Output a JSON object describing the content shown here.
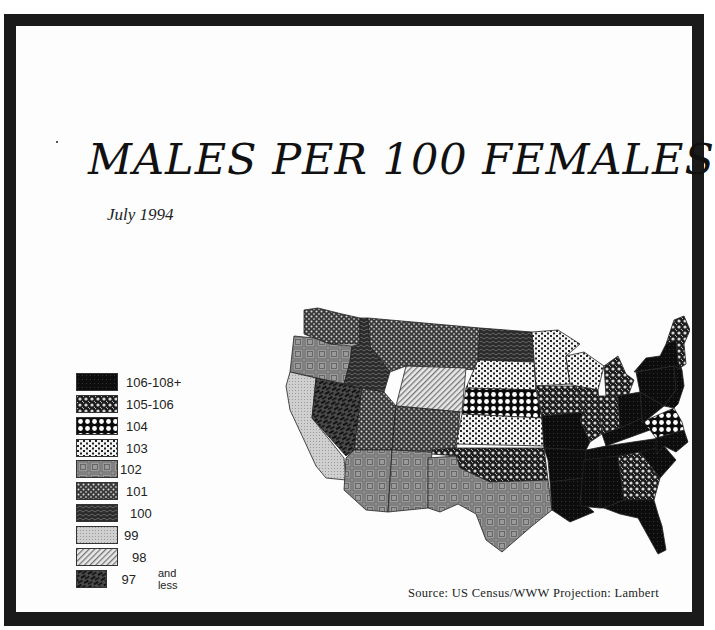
{
  "title": "MALES PER 100 FEMALES",
  "subtitle": "July 1994",
  "source": "Source: US Census/WWW Projection: Lambert",
  "legend": {
    "items": [
      {
        "label": "106-108+",
        "pattern": "p106"
      },
      {
        "label": "105-106",
        "pattern": "p105"
      },
      {
        "label": "104",
        "pattern": "p104"
      },
      {
        "label": "103",
        "pattern": "p103"
      },
      {
        "label": "102",
        "pattern": "p102"
      },
      {
        "label": "101",
        "pattern": "p101"
      },
      {
        "label": "100",
        "pattern": "p100"
      },
      {
        "label": "99",
        "pattern": "p99"
      },
      {
        "label": "98",
        "pattern": "p98"
      },
      {
        "label": "97",
        "pattern": "p97",
        "note": "and less"
      }
    ]
  },
  "map": {
    "projection": "Lambert",
    "regions": [
      {
        "name": "Washington",
        "class": "101"
      },
      {
        "name": "Oregon",
        "class": "102"
      },
      {
        "name": "California",
        "class": "99"
      },
      {
        "name": "Nevada",
        "class": "97"
      },
      {
        "name": "Idaho",
        "class": "100"
      },
      {
        "name": "Montana",
        "class": "101"
      },
      {
        "name": "Wyoming",
        "class": "98"
      },
      {
        "name": "Utah",
        "class": "101"
      },
      {
        "name": "Colorado",
        "class": "101"
      },
      {
        "name": "Arizona",
        "class": "102"
      },
      {
        "name": "New Mexico",
        "class": "102"
      },
      {
        "name": "North Dakota",
        "class": "100"
      },
      {
        "name": "South Dakota",
        "class": "103"
      },
      {
        "name": "Nebraska",
        "class": "104"
      },
      {
        "name": "Kansas",
        "class": "103"
      },
      {
        "name": "Oklahoma",
        "class": "105-106"
      },
      {
        "name": "Texas",
        "class": "102"
      },
      {
        "name": "Minnesota",
        "class": "103"
      },
      {
        "name": "Iowa",
        "class": "105-106"
      },
      {
        "name": "Missouri",
        "class": "106-108+"
      },
      {
        "name": "Wisconsin",
        "class": "103"
      },
      {
        "name": "Illinois",
        "class": "105-106"
      },
      {
        "name": "Michigan",
        "class": "105-106"
      },
      {
        "name": "Indiana",
        "class": "105-106"
      },
      {
        "name": "Ohio",
        "class": "106-108+"
      },
      {
        "name": "Kentucky",
        "class": "106-108+"
      },
      {
        "name": "Tennessee",
        "class": "106-108+"
      },
      {
        "name": "Arkansas",
        "class": "106-108+"
      },
      {
        "name": "Louisiana",
        "class": "106-108+"
      },
      {
        "name": "Mississippi",
        "class": "106-108+"
      },
      {
        "name": "Alabama",
        "class": "106-108+"
      },
      {
        "name": "Georgia",
        "class": "105-106"
      },
      {
        "name": "Florida",
        "class": "106-108+"
      },
      {
        "name": "South Carolina",
        "class": "106-108+"
      },
      {
        "name": "North Carolina",
        "class": "106-108+"
      },
      {
        "name": "Virginia",
        "class": "104"
      },
      {
        "name": "West Virginia",
        "class": "106-108+"
      },
      {
        "name": "Pennsylvania",
        "class": "106-108+"
      },
      {
        "name": "New York",
        "class": "106-108+"
      },
      {
        "name": "New England",
        "class": "105-106"
      }
    ]
  }
}
